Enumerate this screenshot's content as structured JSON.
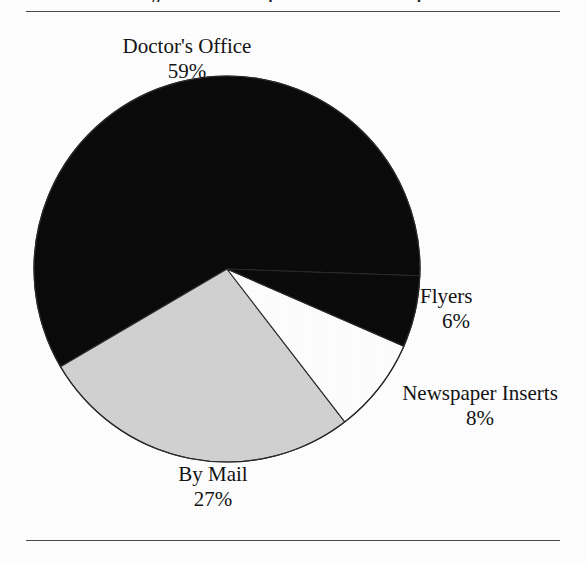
{
  "figure": {
    "caption_clipped": "Figure 1. Where respondents obtained coupons",
    "background_color": "#ffffff",
    "rule_color": "#4a4a4a"
  },
  "chart_data": {
    "type": "pie",
    "title": "",
    "xlabel": "",
    "ylabel": "",
    "legend_position": "none",
    "grid": false,
    "units": "percent",
    "center": {
      "x": 227,
      "y": 269
    },
    "radius": 193,
    "start_angle_deg": -2,
    "direction": "counterclockwise",
    "categories": [
      "Doctor's Office",
      "By Mail",
      "Newspaper Inserts",
      "Flyers"
    ],
    "values": [
      59,
      27,
      8,
      6
    ],
    "value_labels": [
      "59%",
      "27%",
      "8%",
      "6%"
    ],
    "colors": [
      "#0b0b0b",
      "#d2d2d2",
      "#fefefe",
      "#0b0b0b"
    ],
    "slice_outline_color": "#2a2a2a",
    "slices": [
      {
        "name": "Doctor's Office",
        "value": 59,
        "value_label": "59%",
        "color": "#0b0b0b",
        "start_deg": -2,
        "end_deg": 210.4
      },
      {
        "name": "By Mail",
        "value": 27,
        "value_label": "27%",
        "color": "#d2d2d2",
        "start_deg": 210.4,
        "end_deg": 307.6
      },
      {
        "name": "Newspaper Inserts",
        "value": 8,
        "value_label": "8%",
        "color": "#fefefe",
        "start_deg": 307.6,
        "end_deg": 336.4
      },
      {
        "name": "Flyers",
        "value": 6,
        "value_label": "6%",
        "color": "#0b0b0b",
        "start_deg": 336.4,
        "end_deg": 358
      }
    ]
  },
  "labels": {
    "doctors": {
      "name": "Doctor's Office",
      "value": "59%"
    },
    "bymail": {
      "name": "By Mail",
      "value": "27%"
    },
    "newspaper": {
      "name": "Newspaper Inserts",
      "value": "8%"
    },
    "flyers": {
      "name": "Flyers",
      "value": "6%"
    }
  }
}
